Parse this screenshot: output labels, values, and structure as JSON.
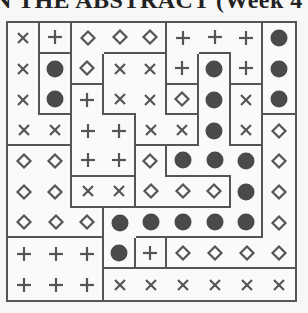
{
  "header": {
    "title": "N THE ABSTRACT (Week 4"
  },
  "puzzle": {
    "rows": 9,
    "cols": 9,
    "symbols": [
      [
        "cross",
        "plus",
        "diamond",
        "diamond",
        "diamond",
        "plus",
        "plus",
        "plus",
        "dot"
      ],
      [
        "cross",
        "dot",
        "diamond",
        "cross",
        "cross",
        "plus",
        "dot",
        "plus",
        "dot"
      ],
      [
        "cross",
        "dot",
        "plus",
        "cross",
        "cross",
        "diamond",
        "dot",
        "cross",
        "dot"
      ],
      [
        "cross",
        "cross",
        "plus",
        "plus",
        "cross",
        "cross",
        "dot",
        "cross",
        "diamond"
      ],
      [
        "diamond",
        "diamond",
        "plus",
        "plus",
        "diamond",
        "dot",
        "dot",
        "dot",
        "diamond"
      ],
      [
        "diamond",
        "diamond",
        "cross",
        "cross",
        "diamond",
        "diamond",
        "diamond",
        "dot",
        "diamond"
      ],
      [
        "diamond",
        "diamond",
        "diamond",
        "dot",
        "dot",
        "dot",
        "dot",
        "dot",
        "diamond"
      ],
      [
        "plus",
        "plus",
        "plus",
        "dot",
        "plus",
        "diamond",
        "diamond",
        "diamond",
        "diamond"
      ],
      [
        "plus",
        "plus",
        "plus",
        "cross",
        "cross",
        "cross",
        "cross",
        "cross",
        "cross"
      ]
    ],
    "regions": [
      [
        "A",
        "B",
        "D",
        "D",
        "D",
        "G",
        "G",
        "G",
        "K"
      ],
      [
        "A",
        "C",
        "D",
        "F",
        "F",
        "G",
        "I",
        "G",
        "K"
      ],
      [
        "A",
        "C",
        "E",
        "F",
        "F",
        "H",
        "I",
        "J",
        "K"
      ],
      [
        "A",
        "A",
        "E",
        "E",
        "F",
        "F",
        "I",
        "J",
        "L"
      ],
      [
        "M",
        "M",
        "E",
        "E",
        "N",
        "I",
        "I",
        "I",
        "L"
      ],
      [
        "M",
        "M",
        "O",
        "O",
        "N",
        "N",
        "N",
        "I",
        "L"
      ],
      [
        "M",
        "M",
        "M",
        "I",
        "I",
        "I",
        "I",
        "I",
        "L"
      ],
      [
        "Q",
        "Q",
        "Q",
        "I",
        "R",
        "L",
        "L",
        "L",
        "L"
      ],
      [
        "Q",
        "Q",
        "Q",
        "T",
        "T",
        "T",
        "T",
        "T",
        "T"
      ]
    ],
    "colors": {
      "ink": "#555555",
      "dot": "#4a4a4a",
      "thin": "#9a9a9a"
    }
  }
}
